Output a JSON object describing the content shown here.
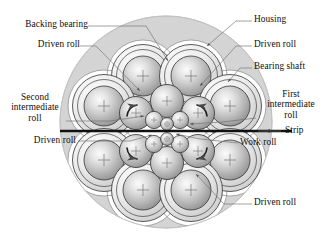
{
  "figure": {
    "type": "technical-diagram",
    "colors": {
      "housing_fill": "#d4d4d4",
      "housing_edge": "#9a9a9a",
      "pocket_fill": "#ffffff",
      "roll_outline": "#3a3a3a",
      "roll_light": "#f2f2f2",
      "roll_mid": "#b8b8b8",
      "roll_dark": "#8c8c8c",
      "strip": "#111111",
      "leader": "#6f6f6f",
      "text": "#0d0d0d"
    },
    "labels": [
      {
        "id": "backing-bearing",
        "text": "Backing bearing",
        "x": 6,
        "y": 23,
        "align": "left"
      },
      {
        "id": "housing",
        "text": "Housing",
        "x": 254,
        "y": 18,
        "align": "left"
      },
      {
        "id": "driven-roll-top-left",
        "text": "Driven roll",
        "x": 33,
        "y": 43,
        "align": "left"
      },
      {
        "id": "driven-roll-top-right",
        "text": "Driven roll",
        "x": 254,
        "y": 43,
        "align": "left"
      },
      {
        "id": "bearing-shaft",
        "text": "Bearing shaft",
        "x": 254,
        "y": 65,
        "align": "left"
      },
      {
        "id": "second-intermediate-roll",
        "text": "Second\nintermediate\nroll",
        "x": 6,
        "y": 94,
        "align": "center"
      },
      {
        "id": "first-intermediate-roll",
        "text": "First\nintermediate\nroll",
        "x": 254,
        "y": 92,
        "align": "center"
      },
      {
        "id": "driven-roll-mid-left",
        "text": "Driven roll",
        "x": 18,
        "y": 139,
        "align": "left"
      },
      {
        "id": "strip",
        "text": "Strip",
        "x": 283,
        "y": 129,
        "align": "left"
      },
      {
        "id": "work-roll",
        "text": "Work roll",
        "x": 240,
        "y": 141,
        "align": "left"
      },
      {
        "id": "driven-roll-bottom",
        "text": "Driven roll",
        "x": 254,
        "y": 201,
        "align": "left"
      }
    ],
    "components": {
      "housing": {
        "center_x": 166,
        "center_y": 122,
        "radius": 106
      },
      "backing_bearings_count": 8,
      "second_intermediate_rolls_count": 6,
      "first_intermediate_rolls_count": 4,
      "work_rolls_count": 2,
      "total_rolls": 20,
      "strip": {
        "x1": 60,
        "x2": 292,
        "y": 131,
        "direction": "left",
        "arrow_x": 272
      }
    }
  }
}
